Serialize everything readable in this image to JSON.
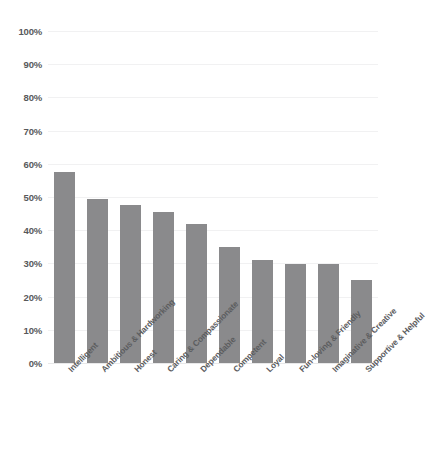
{
  "chart_data": {
    "type": "bar",
    "title": "",
    "subtitle": "",
    "xlabel": "",
    "ylabel": "",
    "ylim": [
      0,
      100
    ],
    "yunit": "%",
    "grid": true,
    "legend": false,
    "orientation": "vertical",
    "bar_color": "#8a8a8c",
    "gridline_color": "#f1f1f2",
    "tick_label_color": "#58595b",
    "category_label_color": "#5c5d5f",
    "background_color": "#ffffff",
    "category_label_rotation": -45,
    "yticks": [
      "0%",
      "10%",
      "20%",
      "30%",
      "40%",
      "50%",
      "60%",
      "70%",
      "80%",
      "90%",
      "100%"
    ],
    "ytick_values": [
      0,
      10,
      20,
      30,
      40,
      50,
      60,
      70,
      80,
      90,
      100
    ],
    "categories": [
      "Intelligent",
      "Ambitious & Hardworking",
      "Honest",
      "Caring & Compassionate",
      "Dependable",
      "Competent",
      "Loyal",
      "Fun-loving & Friendly",
      "Imaginative & Creative",
      "Supportive & Helpful"
    ],
    "values": [
      57.5,
      49.5,
      47.5,
      45.5,
      42,
      35,
      31,
      29.7,
      29.8,
      25
    ]
  }
}
